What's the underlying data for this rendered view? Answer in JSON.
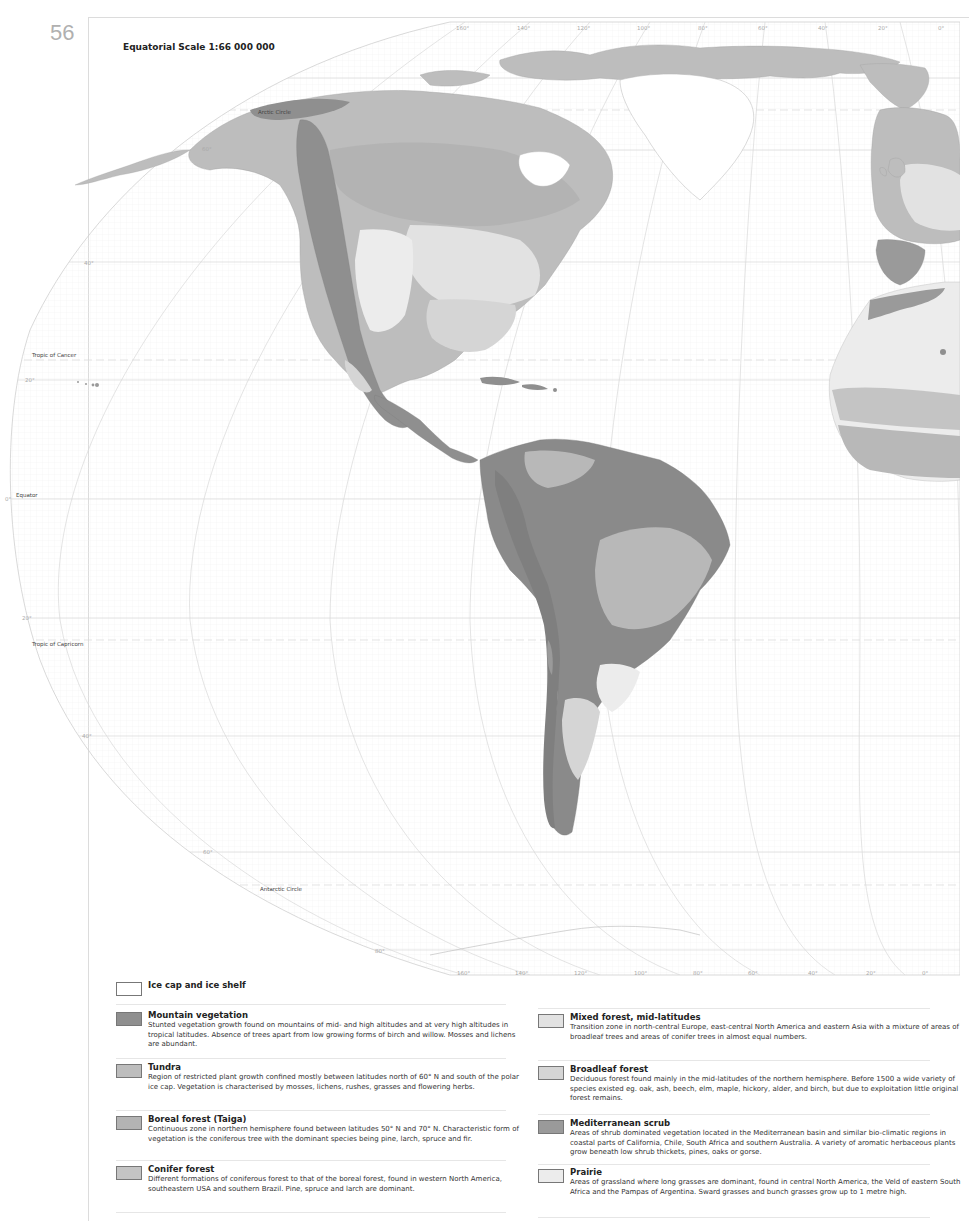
{
  "page": {
    "number": "56",
    "scale": "Equatorial Scale 1:66 000 000"
  },
  "map_labels": {
    "arctic_circle": "Arctic Circle",
    "tropic_of_cancer": "Tropic of Cancer",
    "equator": "Equator",
    "tropic_of_capricorn": "Tropic of Capricorn",
    "antarctic_circle": "Antarctic Circle"
  },
  "latitude_labels": [
    "60°",
    "40°",
    "20°",
    "0°",
    "20°",
    "40°",
    "60°",
    "80°"
  ],
  "longitude_labels_top": [
    "160°",
    "140°",
    "120°",
    "100°",
    "80°",
    "60°",
    "40°",
    "20°",
    "0°"
  ],
  "longitude_labels_bottom": [
    "160°",
    "140°",
    "120°",
    "100°",
    "80°",
    "60°",
    "40°",
    "20°",
    "0°"
  ],
  "colors": {
    "ice": "#ffffff",
    "mountain": "#8f8f8f",
    "tundra": "#bdbdbd",
    "boreal": "#b3b3b3",
    "conifer": "#c4c4c4",
    "mixed": "#e2e2e2",
    "broadleaf": "#d5d5d5",
    "mediterranean": "#9a9a9a",
    "prairie": "#ececec",
    "rainforest": "#8a8a8a",
    "savanna": "#b8b8b8"
  },
  "legend": {
    "left": [
      {
        "title": "Ice cap and ice shelf",
        "desc": ""
      },
      {
        "title": "Mountain vegetation",
        "desc": "Stunted vegetation growth found on mountains of mid- and high altitudes and at very high altitudes in tropical latitudes. Absence of trees apart from low growing forms of birch and willow. Mosses and lichens are abundant."
      },
      {
        "title": "Tundra",
        "desc": "Region of restricted plant growth confined mostly between latitudes north of 60° N and south of the polar ice cap. Vegetation is characterised by mosses, lichens, rushes, grasses and flowering herbs."
      },
      {
        "title": "Boreal forest (Taiga)",
        "desc": "Continuous zone in northern hemisphere found between latitudes 50° N and 70° N. Characteristic form of vegetation is the coniferous tree with the dominant species being pine, larch, spruce and fir."
      },
      {
        "title": "Conifer forest",
        "desc": "Different formations of coniferous forest to that of the boreal forest, found in western North America, southeastern USA and southern Brazil. Pine, spruce and larch are dominant."
      }
    ],
    "right": [
      {
        "title": "Mixed forest, mid-latitudes",
        "desc": "Transition zone in north-central Europe, east-central North America and eastern Asia with a mixture of areas of broadleaf trees and areas of conifer trees in almost equal numbers."
      },
      {
        "title": "Broadleaf forest",
        "desc": "Deciduous forest found mainly in the mid-latitudes of the northern hemisphere. Before 1500 a wide variety of species existed eg. oak, ash, beech, elm, maple, hickory, alder, and birch, but due to exploitation little original forest remains."
      },
      {
        "title": "Mediterranean scrub",
        "desc": "Areas of shrub dominated vegetation located in the Mediterranean basin and similar bio-climatic regions in coastal parts of California, Chile, South Africa and southern Australia. A variety of aromatic herbaceous plants grow beneath low shrub thickets, pines, oaks or gorse."
      },
      {
        "title": "Prairie",
        "desc": "Areas of grassland where long grasses are dominant, found in central North America, the Veld of eastern South Africa and the Pampas of Argentina. Sward grasses and bunch grasses grow up to 1 metre high."
      }
    ]
  }
}
